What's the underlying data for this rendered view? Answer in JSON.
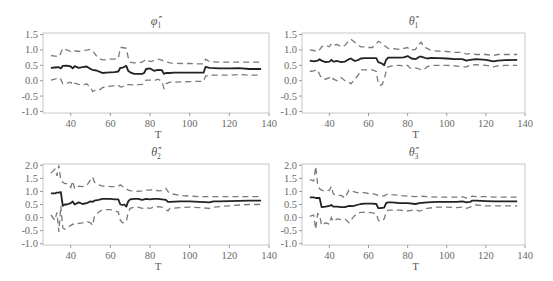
{
  "chart_data": [
    {
      "type": "line",
      "title": "φ̂",
      "title_subscript": "1",
      "xlabel": "T",
      "ylabel": "",
      "xlim": [
        26,
        140
      ],
      "ylim": [
        -1.05,
        1.55
      ],
      "xticks": [
        40,
        60,
        80,
        100,
        120,
        140
      ],
      "yticks": [
        1.5,
        1.0,
        0.5,
        0.0,
        -0.5,
        -1.0
      ],
      "ytick_labels": [
        "1.5",
        "1.0",
        "0.5",
        "0.0",
        "-0.5",
        "-1.0"
      ],
      "grid": false,
      "x": [
        30,
        32,
        34,
        35,
        36,
        38,
        40,
        41,
        42,
        44,
        46,
        48,
        50,
        51,
        53,
        55,
        56,
        58,
        60,
        62,
        64,
        65,
        66,
        68,
        69,
        70,
        72,
        74,
        76,
        77,
        78,
        80,
        82,
        84,
        86,
        87,
        88,
        90,
        92,
        96,
        100,
        104,
        107,
        108,
        110,
        115,
        120,
        125,
        130,
        136
      ],
      "series": [
        {
          "name": "estimate",
          "style": "solid",
          "values": [
            0.42,
            0.43,
            0.44,
            0.4,
            0.48,
            0.49,
            0.46,
            0.4,
            0.47,
            0.42,
            0.44,
            0.46,
            0.38,
            0.35,
            0.33,
            0.28,
            0.25,
            0.26,
            0.27,
            0.28,
            0.3,
            0.42,
            0.42,
            0.48,
            0.32,
            0.27,
            0.22,
            0.22,
            0.22,
            0.25,
            0.38,
            0.4,
            0.32,
            0.35,
            0.34,
            0.22,
            0.25,
            0.25,
            0.26,
            0.26,
            0.26,
            0.26,
            0.26,
            0.45,
            0.42,
            0.4,
            0.4,
            0.41,
            0.38,
            0.38
          ]
        },
        {
          "name": "upper",
          "style": "dashed",
          "values": [
            0.82,
            0.8,
            0.78,
            0.9,
            1.05,
            1.0,
            0.95,
            0.93,
            0.97,
            0.95,
            0.98,
            0.99,
            1.02,
            0.98,
            0.8,
            0.7,
            0.68,
            0.68,
            0.7,
            0.7,
            0.72,
            1.08,
            1.08,
            1.05,
            0.75,
            0.6,
            0.58,
            0.58,
            0.6,
            0.65,
            0.7,
            0.62,
            0.65,
            0.7,
            0.67,
            0.62,
            0.62,
            0.58,
            0.57,
            0.56,
            0.56,
            0.55,
            0.55,
            0.7,
            0.62,
            0.6,
            0.6,
            0.6,
            0.6,
            0.6
          ]
        },
        {
          "name": "lower",
          "style": "dashed",
          "values": [
            0.02,
            0.05,
            0.1,
            0.05,
            -0.1,
            -0.08,
            -0.05,
            -0.15,
            -0.08,
            -0.12,
            -0.15,
            -0.1,
            -0.22,
            -0.35,
            -0.3,
            -0.28,
            -0.22,
            -0.2,
            -0.18,
            -0.16,
            -0.15,
            -0.2,
            -0.2,
            -0.12,
            -0.13,
            -0.13,
            -0.14,
            -0.13,
            -0.12,
            -0.1,
            0.02,
            0.02,
            0.0,
            0.05,
            -0.02,
            -0.25,
            -0.1,
            -0.05,
            -0.05,
            -0.04,
            -0.03,
            -0.02,
            -0.02,
            0.15,
            0.18,
            0.18,
            0.18,
            0.2,
            0.18,
            0.18
          ]
        }
      ]
    },
    {
      "type": "line",
      "title": "θ̂",
      "title_subscript": "1",
      "xlabel": "T",
      "ylabel": "",
      "xlim": [
        26,
        140
      ],
      "ylim": [
        -1.05,
        1.55
      ],
      "xticks": [
        40,
        60,
        80,
        100,
        120,
        140
      ],
      "yticks": [
        1.5,
        1.0,
        0.5,
        0.0,
        -0.5,
        -1.0
      ],
      "ytick_labels": [
        "1.5",
        "1.0",
        "0.5",
        "0.0",
        "-0.5",
        "-1.0"
      ],
      "grid": false,
      "x": [
        30,
        32,
        34,
        35,
        36,
        38,
        40,
        41,
        42,
        44,
        46,
        48,
        50,
        51,
        53,
        55,
        56,
        58,
        60,
        62,
        64,
        65,
        66,
        67,
        68,
        69,
        70,
        72,
        74,
        76,
        78,
        80,
        81,
        82,
        84,
        86,
        87,
        88,
        90,
        92,
        96,
        100,
        104,
        108,
        110,
        112,
        115,
        120,
        124,
        126,
        130,
        136
      ],
      "series": [
        {
          "name": "estimate",
          "style": "solid",
          "values": [
            0.65,
            0.63,
            0.65,
            0.7,
            0.65,
            0.6,
            0.62,
            0.68,
            0.62,
            0.64,
            0.6,
            0.62,
            0.7,
            0.72,
            0.64,
            0.68,
            0.72,
            0.73,
            0.73,
            0.73,
            0.73,
            0.6,
            0.58,
            0.55,
            0.5,
            0.68,
            0.75,
            0.75,
            0.75,
            0.75,
            0.76,
            0.8,
            0.76,
            0.72,
            0.7,
            0.78,
            0.78,
            0.76,
            0.72,
            0.74,
            0.73,
            0.72,
            0.7,
            0.7,
            0.65,
            0.68,
            0.7,
            0.68,
            0.63,
            0.65,
            0.67,
            0.68
          ]
        },
        {
          "name": "upper",
          "style": "dashed",
          "values": [
            1.0,
            0.98,
            0.95,
            1.0,
            1.1,
            1.15,
            1.1,
            1.2,
            1.15,
            1.18,
            1.1,
            1.15,
            1.3,
            1.35,
            1.25,
            1.15,
            1.1,
            1.1,
            1.08,
            1.08,
            1.2,
            1.28,
            1.25,
            1.2,
            1.15,
            1.1,
            1.05,
            1.05,
            1.03,
            1.02,
            1.05,
            1.08,
            1.0,
            1.0,
            1.02,
            1.2,
            1.25,
            1.1,
            1.05,
            0.98,
            0.96,
            0.95,
            0.92,
            0.92,
            0.86,
            0.88,
            0.85,
            0.85,
            0.82,
            0.85,
            0.85,
            0.85
          ]
        },
        {
          "name": "lower",
          "style": "dashed",
          "values": [
            0.3,
            0.32,
            0.35,
            0.2,
            0.08,
            0.05,
            0.1,
            0.15,
            0.05,
            0.0,
            0.1,
            0.0,
            -0.05,
            -0.1,
            0.05,
            0.2,
            0.35,
            0.35,
            0.35,
            0.35,
            0.3,
            -0.1,
            -0.15,
            -0.12,
            0.05,
            0.3,
            0.45,
            0.48,
            0.5,
            0.5,
            0.47,
            0.5,
            0.42,
            0.4,
            0.42,
            0.38,
            0.35,
            0.35,
            0.45,
            0.5,
            0.5,
            0.5,
            0.48,
            0.45,
            0.45,
            0.5,
            0.52,
            0.5,
            0.45,
            0.48,
            0.5,
            0.5
          ]
        }
      ]
    },
    {
      "type": "line",
      "title": "θ̂",
      "title_subscript": "2",
      "xlabel": "T",
      "ylabel": "",
      "xlim": [
        26,
        140
      ],
      "ylim": [
        -1.05,
        2.05
      ],
      "xticks": [
        40,
        60,
        80,
        100,
        120,
        140
      ],
      "yticks": [
        2.0,
        1.5,
        1.0,
        0.5,
        0.0,
        -0.5,
        -1.0
      ],
      "ytick_labels": [
        "2.0",
        "1.5",
        "1.0",
        "0.5",
        "0.0",
        "-0.5",
        "-1.0"
      ],
      "grid": false,
      "x": [
        30,
        32,
        33,
        34,
        35,
        36,
        37,
        38,
        40,
        41,
        42,
        44,
        46,
        48,
        50,
        51,
        52,
        54,
        56,
        58,
        60,
        62,
        64,
        65,
        66,
        67,
        68,
        69,
        70,
        72,
        74,
        76,
        78,
        80,
        82,
        84,
        86,
        88,
        89,
        90,
        95,
        100,
        105,
        110,
        112,
        115,
        120,
        125,
        130,
        136
      ],
      "series": [
        {
          "name": "estimate",
          "style": "solid",
          "values": [
            0.93,
            0.93,
            0.95,
            0.95,
            0.98,
            0.45,
            0.5,
            0.5,
            0.55,
            0.62,
            0.5,
            0.58,
            0.52,
            0.55,
            0.62,
            0.6,
            0.65,
            0.68,
            0.72,
            0.72,
            0.72,
            0.7,
            0.7,
            0.5,
            0.48,
            0.5,
            0.42,
            0.62,
            0.7,
            0.72,
            0.72,
            0.68,
            0.72,
            0.7,
            0.72,
            0.72,
            0.7,
            0.68,
            0.6,
            0.6,
            0.62,
            0.62,
            0.6,
            0.58,
            0.62,
            0.62,
            0.63,
            0.64,
            0.65,
            0.65
          ]
        },
        {
          "name": "upper",
          "style": "dashed",
          "values": [
            1.7,
            1.85,
            1.6,
            2.0,
            1.4,
            1.35,
            1.3,
            1.3,
            1.15,
            1.4,
            1.1,
            1.2,
            1.18,
            1.22,
            1.45,
            1.55,
            1.35,
            1.25,
            1.2,
            1.2,
            1.18,
            1.18,
            1.2,
            1.25,
            1.2,
            1.15,
            1.1,
            1.05,
            1.03,
            1.02,
            1.0,
            1.02,
            1.05,
            1.05,
            1.08,
            1.02,
            1.03,
            1.12,
            1.0,
            0.92,
            0.85,
            0.82,
            0.8,
            0.8,
            0.8,
            0.8,
            0.8,
            0.8,
            0.8,
            0.8
          ]
        },
        {
          "name": "lower",
          "style": "dashed",
          "values": [
            0.1,
            -0.1,
            0.2,
            -0.55,
            0.45,
            -0.4,
            -0.45,
            -0.4,
            -0.3,
            -0.25,
            -0.28,
            -0.22,
            -0.2,
            -0.15,
            -0.2,
            -0.3,
            0.05,
            0.2,
            0.3,
            0.3,
            0.3,
            0.25,
            0.22,
            -0.1,
            -0.2,
            -0.18,
            -0.15,
            0.2,
            0.35,
            0.4,
            0.4,
            0.35,
            0.38,
            0.35,
            0.4,
            0.42,
            0.4,
            0.3,
            0.25,
            0.35,
            0.38,
            0.4,
            0.38,
            0.35,
            0.4,
            0.42,
            0.45,
            0.48,
            0.5,
            0.5
          ]
        }
      ]
    },
    {
      "type": "line",
      "title": "θ̂",
      "title_subscript": "3",
      "xlabel": "T",
      "ylabel": "",
      "xlim": [
        26,
        140
      ],
      "ylim": [
        -1.05,
        2.05
      ],
      "xticks": [
        40,
        60,
        80,
        100,
        120,
        140
      ],
      "yticks": [
        2.0,
        1.5,
        1.0,
        0.5,
        0.0,
        -0.5,
        -1.0
      ],
      "ytick_labels": [
        "2.0",
        "1.5",
        "1.0",
        "0.5",
        "0.0",
        "-0.5",
        "-1.0"
      ],
      "grid": false,
      "x": [
        30,
        32,
        33,
        34,
        35,
        36,
        38,
        40,
        41,
        42,
        44,
        46,
        48,
        50,
        52,
        54,
        56,
        58,
        60,
        62,
        64,
        65,
        66,
        68,
        69,
        70,
        72,
        76,
        80,
        84,
        86,
        90,
        95,
        100,
        105,
        108,
        110,
        112,
        113,
        115,
        120,
        125,
        130,
        136
      ],
      "series": [
        {
          "name": "estimate",
          "style": "solid",
          "values": [
            0.77,
            0.77,
            0.75,
            0.75,
            0.75,
            0.4,
            0.42,
            0.45,
            0.48,
            0.42,
            0.42,
            0.4,
            0.4,
            0.45,
            0.44,
            0.48,
            0.52,
            0.53,
            0.53,
            0.53,
            0.52,
            0.36,
            0.36,
            0.38,
            0.55,
            0.58,
            0.58,
            0.55,
            0.55,
            0.52,
            0.55,
            0.58,
            0.6,
            0.6,
            0.6,
            0.62,
            0.58,
            0.6,
            0.65,
            0.65,
            0.63,
            0.62,
            0.62,
            0.62
          ]
        },
        {
          "name": "upper",
          "style": "dashed",
          "values": [
            1.45,
            1.4,
            1.95,
            1.3,
            1.1,
            1.05,
            1.0,
            1.05,
            1.2,
            0.9,
            0.85,
            0.85,
            0.75,
            1.05,
            1.0,
            0.95,
            0.95,
            0.95,
            0.92,
            0.92,
            0.88,
            0.85,
            0.85,
            0.82,
            0.88,
            0.9,
            0.88,
            0.85,
            0.82,
            0.8,
            0.82,
            0.8,
            0.78,
            0.78,
            0.78,
            0.8,
            0.75,
            0.78,
            0.82,
            0.8,
            0.8,
            0.78,
            0.78,
            0.78
          ]
        },
        {
          "name": "lower",
          "style": "dashed",
          "values": [
            0.05,
            0.1,
            -0.45,
            0.15,
            0.1,
            -0.3,
            -0.2,
            -0.25,
            0.0,
            -0.15,
            -0.05,
            -0.08,
            -0.05,
            -0.2,
            0.0,
            0.15,
            0.2,
            0.2,
            0.2,
            0.18,
            0.15,
            -0.1,
            -0.15,
            -0.05,
            0.2,
            0.28,
            0.28,
            0.28,
            0.25,
            0.3,
            0.25,
            0.35,
            0.4,
            0.4,
            0.38,
            0.4,
            0.35,
            0.4,
            0.45,
            0.48,
            0.45,
            0.45,
            0.45,
            0.45
          ]
        }
      ]
    }
  ]
}
